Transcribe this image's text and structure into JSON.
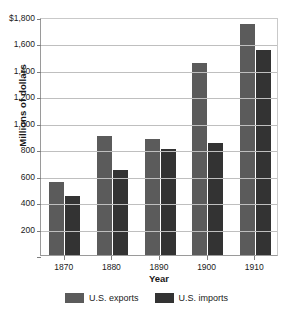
{
  "chart_data": {
    "type": "bar",
    "title": "",
    "xlabel": "Year",
    "ylabel": "Millions of dollars",
    "categories": [
      "1870",
      "1880",
      "1890",
      "1900",
      "1910"
    ],
    "series": [
      {
        "name": "U.S. exports",
        "color": "#5b5b5b",
        "values": [
          550,
          900,
          880,
          1450,
          1750
        ]
      },
      {
        "name": "U.S. imports",
        "color": "#333333",
        "values": [
          445,
          645,
          800,
          850,
          1550
        ]
      }
    ],
    "ylim": [
      0,
      1800
    ],
    "ytick_values": [
      0,
      200,
      400,
      600,
      800,
      1000,
      1200,
      1400,
      1600,
      1800
    ],
    "ytick_labels": [
      "",
      "200",
      "400",
      "600",
      "800",
      "1,000",
      "1,200",
      "1,400",
      "1,600",
      "$1,800"
    ],
    "grid": true,
    "legend_position": "bottom"
  },
  "legend": {
    "items": [
      {
        "label": "U.S. exports",
        "swatch": "exports-swatch"
      },
      {
        "label": "U.S. imports",
        "swatch": "imports-swatch"
      }
    ]
  }
}
